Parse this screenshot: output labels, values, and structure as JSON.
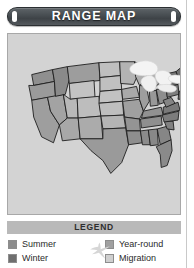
{
  "card": {
    "title": "RANGE MAP",
    "background_color": "#ffffff"
  },
  "title_banner": {
    "label": "RANGE MAP",
    "plate_color": "#4a5054",
    "text_color": "#ffffff"
  },
  "map_panel": {
    "background_color": "#d3d3d3",
    "border_color": "#a8a8a8",
    "region": "United States",
    "lakes_color": "#f2f2f2",
    "outline_color": "#1c1c1c"
  },
  "legend": {
    "header": "LEGEND",
    "header_bar_color": "#b9b9b9",
    "icon": "bird-icon",
    "icon_color": "#d6d6d6",
    "columns": [
      {
        "items": [
          {
            "label": "Summer",
            "swatch_color": "#8c8c8c",
            "key": "summer"
          },
          {
            "label": "Winter",
            "swatch_color": "#6f6f6f",
            "key": "winter"
          }
        ]
      },
      {
        "items": [
          {
            "label": "Year-round",
            "swatch_color": "#a0a0a0",
            "key": "year-round"
          },
          {
            "label": "Migration",
            "swatch_color": "#cfcfcf",
            "key": "migration"
          }
        ]
      }
    ]
  }
}
